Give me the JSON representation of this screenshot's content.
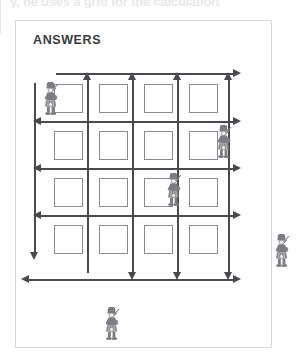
{
  "page": {
    "top_cut_text": "y, he uses a grid for the calculation"
  },
  "panel": {
    "title": "ANSWERS"
  },
  "colors": {
    "box_border": "#8a8a90",
    "arrow": "#4a4a4e",
    "panel_border": "#d9d9dd",
    "title_text": "#3b3b3f",
    "figure": "#7c7c82"
  },
  "grid": {
    "rows": 4,
    "cols": 4,
    "box_size": 29,
    "cells": [
      {
        "row": 0,
        "col": 0,
        "value": ""
      },
      {
        "row": 0,
        "col": 1,
        "value": ""
      },
      {
        "row": 0,
        "col": 2,
        "value": ""
      },
      {
        "row": 0,
        "col": 3,
        "value": ""
      },
      {
        "row": 1,
        "col": 0,
        "value": ""
      },
      {
        "row": 1,
        "col": 1,
        "value": ""
      },
      {
        "row": 1,
        "col": 2,
        "value": ""
      },
      {
        "row": 1,
        "col": 3,
        "value": ""
      },
      {
        "row": 2,
        "col": 0,
        "value": ""
      },
      {
        "row": 2,
        "col": 1,
        "value": ""
      },
      {
        "row": 2,
        "col": 2,
        "value": ""
      },
      {
        "row": 2,
        "col": 3,
        "value": ""
      },
      {
        "row": 3,
        "col": 0,
        "value": ""
      },
      {
        "row": 3,
        "col": 1,
        "value": ""
      },
      {
        "row": 3,
        "col": 2,
        "value": ""
      },
      {
        "row": 3,
        "col": 3,
        "value": ""
      }
    ]
  },
  "arrows": [
    {
      "name": "top-horizontal-arrow",
      "orientation": "horizontal",
      "direction": "right"
    },
    {
      "name": "row-divider-1-arrow",
      "orientation": "horizontal",
      "direction": "both"
    },
    {
      "name": "row-divider-2-arrow",
      "orientation": "horizontal",
      "direction": "both"
    },
    {
      "name": "row-divider-3-arrow",
      "orientation": "horizontal",
      "direction": "both"
    },
    {
      "name": "bottom-horizontal-arrow",
      "orientation": "horizontal",
      "direction": "both"
    },
    {
      "name": "left-vertical-arrow",
      "orientation": "vertical",
      "direction": "down"
    },
    {
      "name": "col-divider-1-arrow",
      "orientation": "vertical",
      "direction": "up"
    },
    {
      "name": "col-divider-2-arrow",
      "orientation": "vertical",
      "direction": "both"
    },
    {
      "name": "col-divider-3-arrow",
      "orientation": "vertical",
      "direction": "both"
    },
    {
      "name": "right-vertical-arrow",
      "orientation": "vertical",
      "direction": "both"
    }
  ],
  "figures": [
    {
      "name": "piper-figure-top-left",
      "x": 25,
      "y": 61
    },
    {
      "name": "piper-figure-upper-right",
      "x": 198,
      "y": 104
    },
    {
      "name": "piper-figure-center",
      "x": 148,
      "y": 152
    },
    {
      "name": "piper-figure-mid-right",
      "x": 256,
      "y": 213
    },
    {
      "name": "piper-figure-bottom-left",
      "x": 86,
      "y": 286
    }
  ]
}
